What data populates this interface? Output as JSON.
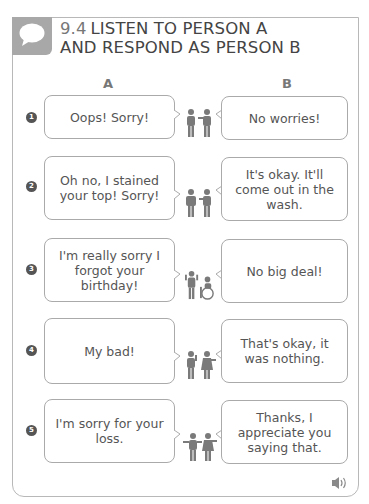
{
  "exercise": {
    "number": "9.4",
    "title_line1": "LISTEN TO PERSON A",
    "title_line2": "AND RESPOND AS PERSON B",
    "icon": "speech-bubble-icon"
  },
  "columns": {
    "a": "A",
    "b": "B"
  },
  "rows": [
    {
      "num": "1",
      "a": "Oops! Sorry!",
      "b": "No worries!"
    },
    {
      "num": "2",
      "a": "Oh no, I stained your top! Sorry!",
      "b": "It's okay. It'll come out in the wash."
    },
    {
      "num": "3",
      "a": "I'm really sorry I forgot your birthday!",
      "b": "No big deal!"
    },
    {
      "num": "4",
      "a": "My bad!",
      "b": "That's okay, it was nothing."
    },
    {
      "num": "5",
      "a": "I'm sorry for your loss.",
      "b": "Thanks, I appreciate you saying that."
    }
  ],
  "audio": {
    "icon": "speaker-icon"
  },
  "colors": {
    "frame": "#b8b8b8",
    "tab": "#a8a8a8",
    "badge": "#555555",
    "figure": "#7a7a7a"
  }
}
